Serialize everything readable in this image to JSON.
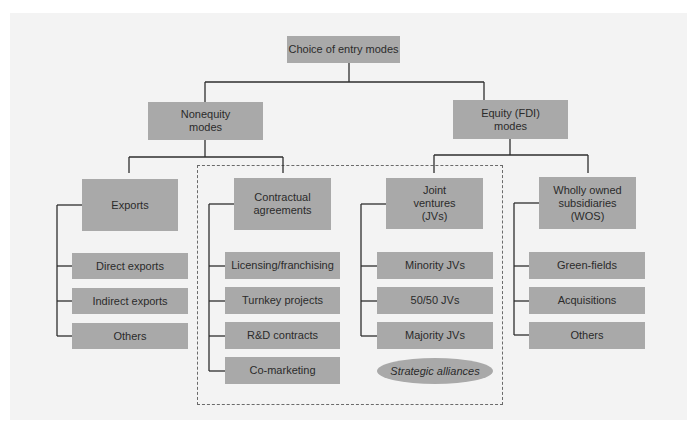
{
  "diagram": {
    "root": {
      "label": "Choice of entry modes"
    },
    "branches": [
      {
        "label": "Nonequity\nmodes",
        "children": [
          {
            "label": "Exports",
            "items": [
              "Direct exports",
              "Indirect exports",
              "Others"
            ]
          },
          {
            "label": "Contractual\nagreements",
            "items": [
              "Licensing/franchising",
              "Turnkey projects",
              "R&D contracts",
              "Co-marketing"
            ]
          }
        ]
      },
      {
        "label": "Equity (FDI)\nmodes",
        "children": [
          {
            "label": "Joint\nventures\n(JVs)",
            "items": [
              "Minority JVs",
              "50/50 JVs",
              "Majority JVs"
            ]
          },
          {
            "label": "Wholly owned\nsubsidiaries\n(WOS)",
            "items": [
              "Green-fields",
              "Acquisitions",
              "Others"
            ]
          }
        ]
      }
    ],
    "strategic_alliances": {
      "label": "Strategic alliances",
      "style": "ellipse, dashed grouping around Contractual agreements and Joint ventures"
    },
    "colors": {
      "box_fill": "#a9a9a9",
      "line": "#2e2e2e",
      "dashed": "#6a6a6a",
      "panel": "#f3f3f3",
      "text": "#2b2b2b"
    }
  },
  "labels": {
    "root": "Choice of entry modes",
    "nonequity_1": "Nonequity",
    "nonequity_2": "modes",
    "equity_1": "Equity (FDI)",
    "equity_2": "modes",
    "exports": "Exports",
    "contractual_1": "Contractual",
    "contractual_2": "agreements",
    "jv_1": "Joint",
    "jv_2": "ventures",
    "jv_3": "(JVs)",
    "wos_1": "Wholly owned",
    "wos_2": "subsidiaries",
    "wos_3": "(WOS)",
    "exports_items": [
      "Direct exports",
      "Indirect exports",
      "Others"
    ],
    "contractual_items": [
      "Licensing/franchising",
      "Turnkey projects",
      "R&D contracts",
      "Co-marketing"
    ],
    "jv_items": [
      "Minority JVs",
      "50/50 JVs",
      "Majority JVs"
    ],
    "wos_items": [
      "Green-fields",
      "Acquisitions",
      "Others"
    ],
    "alliances": "Strategic alliances"
  }
}
